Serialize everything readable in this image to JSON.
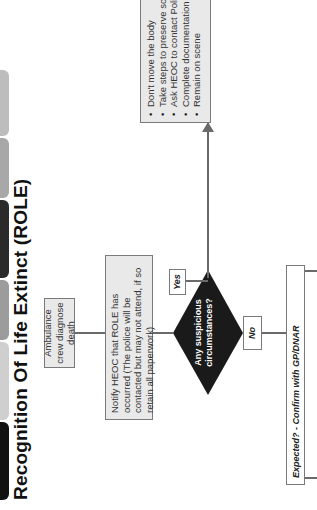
{
  "tabs": [
    {
      "label": "",
      "color": "#111111"
    },
    {
      "label": "",
      "color": "#c8c8c8"
    },
    {
      "label": "",
      "color": "#9a9a9a"
    },
    {
      "label": "",
      "color": "#2a2a2a"
    },
    {
      "label": "",
      "color": "#a0a0a0"
    },
    {
      "label": "",
      "color": "#b5b5b5"
    }
  ],
  "title": "Recognition Of Life Extinct (ROLE)",
  "flow": {
    "start": "Ambulance crew diagnose death",
    "notify": "Notify HEOC that ROLE has occurred (The police will be contacted but may not attend, if so retain all paperwork)",
    "decision": "Any suspicious circumstances?",
    "yes_label": "Yes",
    "no_label": "No",
    "expected": "Expected? - Confirm with GP/DNAR",
    "suspicious_actions": [
      "Don't move the body",
      "Take steps to preserve scene",
      "Ask HEOC to contact Police",
      "Complete documentation",
      "Remain on scene"
    ]
  },
  "colors": {
    "box_fill": "#e9e9e9",
    "box_border": "#7a7a7a",
    "diamond": "#1a1a1a",
    "connector": "#6a6a6a"
  }
}
